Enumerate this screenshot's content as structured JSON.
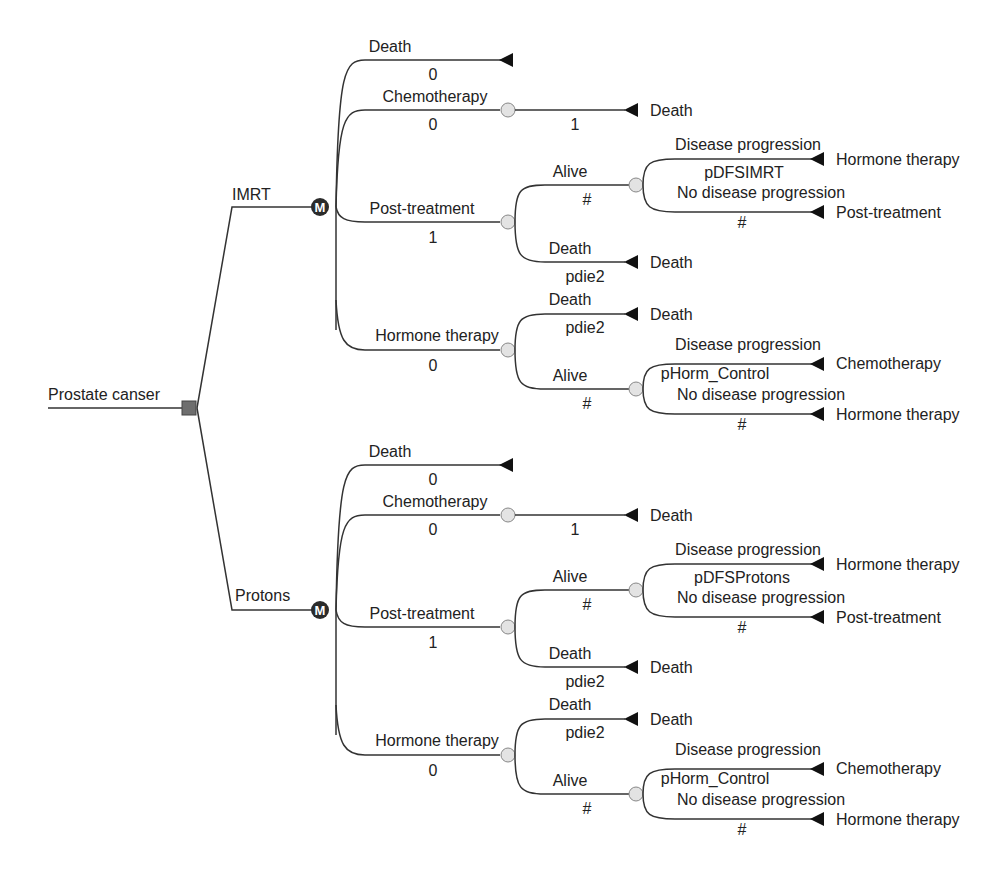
{
  "diagram": {
    "type": "decision-tree",
    "root": {
      "label": "Prostate canser",
      "node": "decision"
    },
    "markov_symbol": "M",
    "strategies": [
      {
        "name": "IMRT",
        "node": "markov",
        "states": [
          {
            "label": "Death",
            "prob": "0",
            "node": "terminal"
          },
          {
            "label": "Chemotherapy",
            "prob": "0",
            "node": "chance",
            "children": [
              {
                "label": "",
                "prob": "1",
                "node": "terminal",
                "jump_to": "Death"
              }
            ]
          },
          {
            "label": "Post-treatment",
            "prob": "1",
            "node": "chance",
            "children": [
              {
                "label": "Alive",
                "prob": "#",
                "node": "chance",
                "children": [
                  {
                    "label": "Disease progression",
                    "prob": "pDFSIMRT",
                    "node": "terminal",
                    "jump_to": "Hormone therapy"
                  },
                  {
                    "label": "No disease progression",
                    "prob": "#",
                    "node": "terminal",
                    "jump_to": "Post-treatment"
                  }
                ]
              },
              {
                "label": "Death",
                "prob": "pdie2",
                "node": "terminal",
                "jump_to": "Death"
              }
            ]
          },
          {
            "label": "Hormone therapy",
            "prob": "0",
            "node": "chance",
            "children": [
              {
                "label": "Death",
                "prob": "pdie2",
                "node": "terminal",
                "jump_to": "Death"
              },
              {
                "label": "Alive",
                "prob": "#",
                "node": "chance",
                "children": [
                  {
                    "label": "Disease progression",
                    "prob": "pHorm_Control",
                    "node": "terminal",
                    "jump_to": "Chemotherapy"
                  },
                  {
                    "label": "No disease progression",
                    "prob": "#",
                    "node": "terminal",
                    "jump_to": "Hormone therapy"
                  }
                ]
              }
            ]
          }
        ]
      },
      {
        "name": "Protons",
        "node": "markov",
        "states": [
          {
            "label": "Death",
            "prob": "0",
            "node": "terminal"
          },
          {
            "label": "Chemotherapy",
            "prob": "0",
            "node": "chance",
            "children": [
              {
                "label": "",
                "prob": "1",
                "node": "terminal",
                "jump_to": "Death"
              }
            ]
          },
          {
            "label": "Post-treatment",
            "prob": "1",
            "node": "chance",
            "children": [
              {
                "label": "Alive",
                "prob": "#",
                "node": "chance",
                "children": [
                  {
                    "label": "Disease progression",
                    "prob": "pDFSProtons",
                    "node": "terminal",
                    "jump_to": "Hormone therapy"
                  },
                  {
                    "label": "No disease progression",
                    "prob": "#",
                    "node": "terminal",
                    "jump_to": "Post-treatment"
                  }
                ]
              },
              {
                "label": "Death",
                "prob": "pdie2",
                "node": "terminal",
                "jump_to": "Death"
              }
            ]
          },
          {
            "label": "Hormone therapy",
            "prob": "0",
            "node": "chance",
            "children": [
              {
                "label": "Death",
                "prob": "pdie2",
                "node": "terminal",
                "jump_to": "Death"
              },
              {
                "label": "Alive",
                "prob": "#",
                "node": "chance",
                "children": [
                  {
                    "label": "Disease progression",
                    "prob": "pHorm_Control",
                    "node": "terminal",
                    "jump_to": "Chemotherapy"
                  },
                  {
                    "label": "No disease progression",
                    "prob": "#",
                    "node": "terminal",
                    "jump_to": "Hormone therapy"
                  }
                ]
              }
            ]
          }
        ]
      }
    ]
  }
}
